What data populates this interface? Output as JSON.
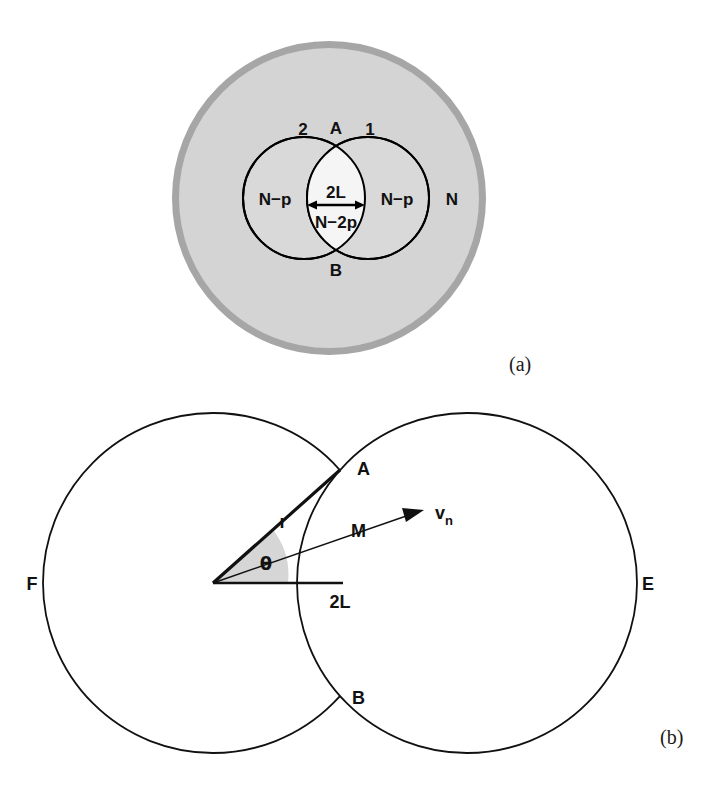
{
  "figure": {
    "type": "scientific-diagram",
    "background_color": "#ffffff",
    "panels": [
      {
        "id": "a",
        "label": "(a)"
      },
      {
        "id": "b",
        "label": "(b)"
      }
    ]
  },
  "panel_a": {
    "label": "(a)",
    "colors": {
      "outer_ring": "#a6a6a6",
      "outer_fill": "#d4d4d4",
      "inner_fill": "#d9d9d9",
      "lens_fill": "#f2f2f2",
      "stroke": "#000000"
    },
    "geometry": {
      "outer_circle": {
        "cx": 329,
        "cy": 198,
        "r": 157,
        "ring_width": 7
      },
      "left_circle": {
        "cx": 304,
        "cy": 198,
        "r": 61
      },
      "right_circle": {
        "cx": 368,
        "cy": 198,
        "r": 61
      },
      "point_A": {
        "x": 336,
        "y": 137
      },
      "point_B": {
        "x": 336,
        "y": 259
      }
    },
    "labels": {
      "circle_2": "2",
      "point_A": "A",
      "circle_1": "1",
      "left_region": "N−p",
      "right_region": "N−p",
      "lens_width": "2L",
      "lens_region": "N−2p",
      "point_B": "B",
      "outer_region": "N"
    }
  },
  "panel_b": {
    "label": "(b)",
    "colors": {
      "stroke": "#111111",
      "fill": "#ffffff",
      "angle_wedge": "#d6d6d6"
    },
    "geometry": {
      "left_circle": {
        "cx": 213,
        "cy": 583,
        "r": 170
      },
      "right_circle": {
        "cx": 467,
        "cy": 583,
        "r": 170
      },
      "point_A": {
        "x": 340,
        "y": 470
      },
      "point_B": {
        "x": 340,
        "y": 696
      },
      "point_M": {
        "x": 340,
        "y": 531
      },
      "center": {
        "x": 213,
        "y": 583
      }
    },
    "labels": {
      "left_circle": "F",
      "right_circle": "E",
      "point_A": "A",
      "point_B": "B",
      "point_M": "M",
      "radius": "r",
      "angle": "θ",
      "velocity": "v",
      "velocity_sub": "n",
      "chord": "2L"
    }
  }
}
